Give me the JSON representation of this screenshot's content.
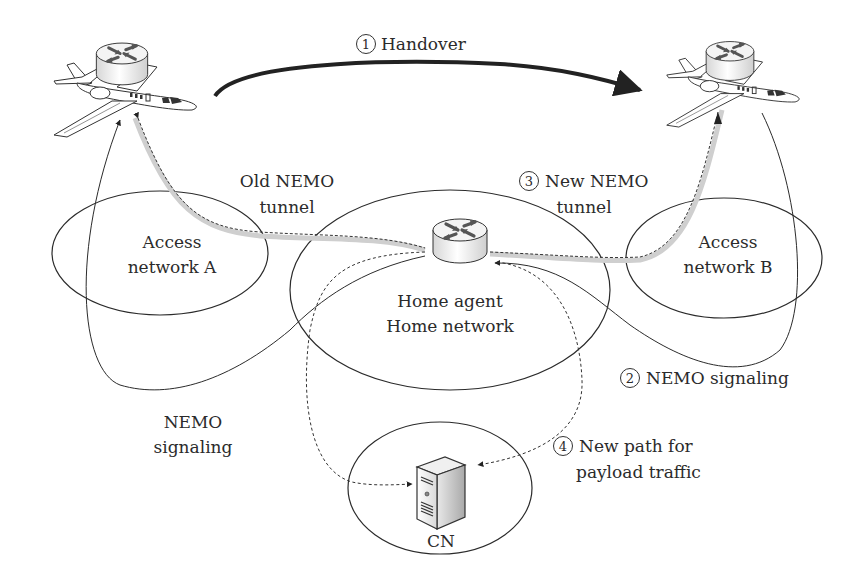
{
  "diagram": {
    "type": "network-mobility-handover",
    "colors": {
      "line": "#2b2b2b",
      "tunnel_halo": "#c8c8c8",
      "router_top": "#f2f2f2",
      "router_arrow": "#555555",
      "background": "#ffffff"
    },
    "steps": {
      "handover": {
        "num": "1",
        "label": "Handover"
      },
      "nemo_signaling_right": {
        "num": "2",
        "label": "NEMO signaling"
      },
      "new_tunnel": {
        "num": "3",
        "line1": "New NEMO",
        "line2": "tunnel"
      },
      "new_path": {
        "num": "4",
        "line1": "New path for",
        "line2": "payload traffic"
      }
    },
    "labels": {
      "old_tunnel_line1": "Old NEMO",
      "old_tunnel_line2": "tunnel",
      "access_a_line1": "Access",
      "access_a_line2": "network A",
      "access_b_line1": "Access",
      "access_b_line2": "network B",
      "home_line1": "Home agent",
      "home_line2": "Home network",
      "nemo_signaling_left_line1": "NEMO",
      "nemo_signaling_left_line2": "signaling",
      "cn": "CN"
    },
    "nodes": [
      {
        "id": "mobile-router-old",
        "icon": "airplane-with-router",
        "position": "top-left"
      },
      {
        "id": "mobile-router-new",
        "icon": "airplane-with-router",
        "position": "top-right"
      },
      {
        "id": "home-agent-router",
        "icon": "router",
        "position": "center"
      },
      {
        "id": "correspondent-node",
        "icon": "server",
        "position": "bottom-center"
      }
    ],
    "networks": [
      "Access network A",
      "Home network",
      "Access network B",
      "CN network"
    ]
  }
}
